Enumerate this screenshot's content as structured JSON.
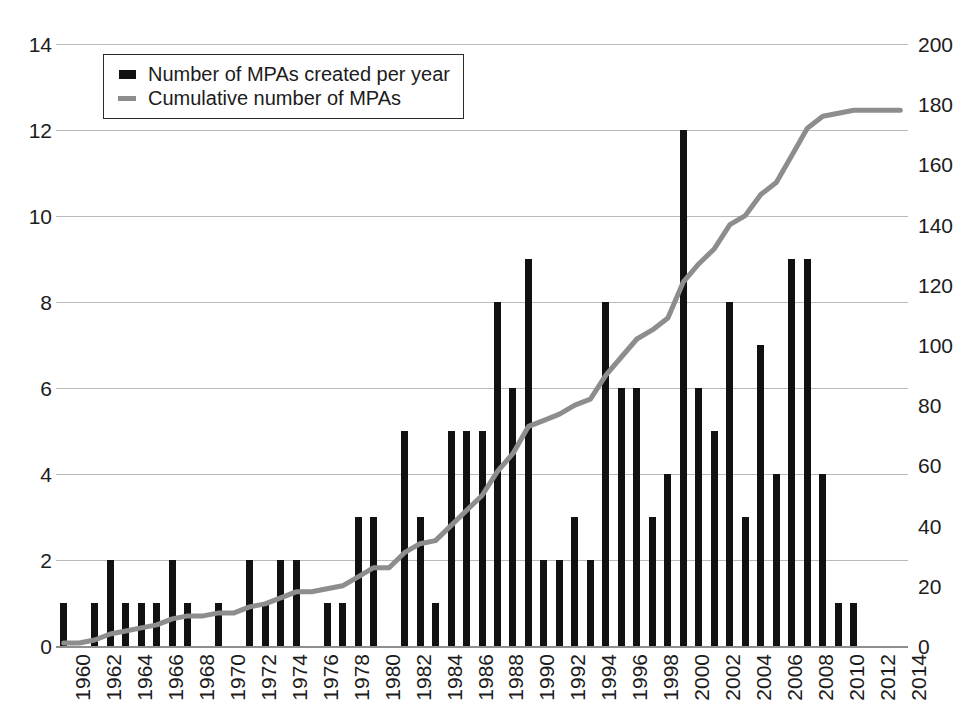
{
  "chart_data": {
    "type": "bar",
    "title": "",
    "subtitle": "",
    "xlabel": "",
    "ylabel": "",
    "y2label": "",
    "grid": true,
    "legend_position": "top-left",
    "xlim": [
      1960,
      2014
    ],
    "xtick_step": 2,
    "ylim": [
      0,
      14
    ],
    "ytick_step": 2,
    "y2lim": [
      0,
      200
    ],
    "y2tick_step": 20,
    "xticks": [
      "1960",
      "1962",
      "1964",
      "1966",
      "1968",
      "1970",
      "1972",
      "1974",
      "1976",
      "1978",
      "1980",
      "1982",
      "1984",
      "1986",
      "1988",
      "1990",
      "1992",
      "1994",
      "1996",
      "1998",
      "2000",
      "2002",
      "2004",
      "2006",
      "2008",
      "2010",
      "2012",
      "2014"
    ],
    "yticks_left": [
      "0",
      "2",
      "4",
      "6",
      "8",
      "10",
      "12",
      "14"
    ],
    "yticks_right": [
      "0",
      "20",
      "40",
      "60",
      "80",
      "100",
      "120",
      "140",
      "160",
      "180",
      "200"
    ],
    "categories": [
      1960,
      1961,
      1962,
      1963,
      1964,
      1965,
      1966,
      1967,
      1968,
      1969,
      1970,
      1971,
      1972,
      1973,
      1974,
      1975,
      1976,
      1977,
      1978,
      1979,
      1980,
      1981,
      1982,
      1983,
      1984,
      1985,
      1986,
      1987,
      1988,
      1989,
      1990,
      1991,
      1992,
      1993,
      1994,
      1995,
      1996,
      1997,
      1998,
      1999,
      2000,
      2001,
      2002,
      2003,
      2004,
      2005,
      2006,
      2007,
      2008,
      2009,
      2010,
      2011,
      2012,
      2013,
      2014
    ],
    "series": [
      {
        "name": "Number of MPAs created per year",
        "axis": "left",
        "color": "#111111",
        "style": "bar",
        "values": [
          1,
          0,
          1,
          2,
          1,
          1,
          1,
          2,
          1,
          0,
          1,
          0,
          2,
          1,
          2,
          2,
          0,
          1,
          1,
          3,
          3,
          0,
          5,
          3,
          1,
          5,
          5,
          5,
          8,
          6,
          9,
          2,
          2,
          3,
          2,
          8,
          6,
          6,
          3,
          4,
          12,
          6,
          5,
          8,
          3,
          7,
          4,
          9,
          9,
          4,
          1,
          1,
          0,
          0,
          0
        ]
      },
      {
        "name": "Cumulative number of MPAs",
        "axis": "right",
        "color": "#8d8d8d",
        "style": "line",
        "values": [
          1,
          1,
          2,
          4,
          5,
          6,
          7,
          9,
          10,
          10,
          11,
          11,
          13,
          14,
          16,
          18,
          18,
          19,
          20,
          23,
          26,
          26,
          31,
          34,
          35,
          40,
          45,
          50,
          58,
          64,
          73,
          75,
          77,
          80,
          82,
          90,
          96,
          102,
          105,
          109,
          121,
          127,
          132,
          140,
          143,
          150,
          154,
          163,
          172,
          176,
          177,
          178,
          178,
          178,
          178
        ]
      }
    ],
    "cumulative_final_label": "183"
  },
  "legend": {
    "items": [
      {
        "label": "Number of MPAs created per year",
        "swatch": "bar-swatch",
        "color": "#111111"
      },
      {
        "label": "Cumulative number of MPAs",
        "swatch": "line-swatch",
        "color": "#8d8d8d"
      }
    ]
  },
  "colors": {
    "bar": "#111111",
    "line": "#8d8d8d",
    "grid": "#b9b9b9",
    "axis": "#8f8f8f",
    "text": "#1c1c1c",
    "background": "#ffffff"
  }
}
